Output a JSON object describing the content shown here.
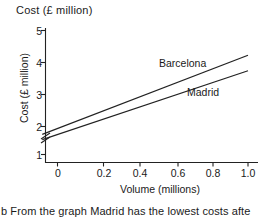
{
  "chart_data": {
    "type": "line",
    "title": "Cost (£ million)",
    "xlabel": "Volume (millions)",
    "ylabel": "Cost (£ million)",
    "xlim": [
      -0.085,
      1.03
    ],
    "ylim": [
      0.62,
      5.25
    ],
    "y_axis_break": true,
    "grid": false,
    "legend_position": "inline-right",
    "xticks": [
      "0",
      "0.2",
      "0.4",
      "0.6",
      "0.8",
      "1.0"
    ],
    "xtick_values": [
      0,
      0.2,
      0.4,
      0.6,
      0.8,
      1.0
    ],
    "yticks": [
      "1",
      "2",
      "3",
      "4",
      "5"
    ],
    "ytick_values": [
      1,
      2,
      3,
      4,
      5
    ],
    "line_color": "#222222",
    "series": [
      {
        "name": "Barcelona",
        "x": [
          -0.08,
          1.0
        ],
        "values": [
          1.65,
          4.2
        ]
      },
      {
        "name": "Madrid",
        "x": [
          -0.08,
          1.0
        ],
        "values": [
          1.48,
          3.7
        ]
      }
    ]
  },
  "caption": {
    "text": "b  From the graph Madrid has the lowest costs afte"
  }
}
